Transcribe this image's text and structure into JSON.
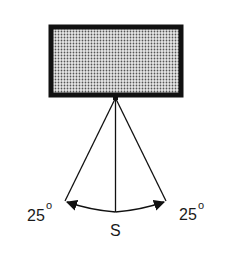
{
  "diagram": {
    "type": "pendulum-swing",
    "object": {
      "name": "suspended-box",
      "fill": "stippled-gray",
      "border_color": "#111111"
    },
    "center_label": "S",
    "left_angle": {
      "value": "25",
      "unit": "o"
    },
    "right_angle": {
      "value": "25",
      "unit": "o"
    }
  }
}
